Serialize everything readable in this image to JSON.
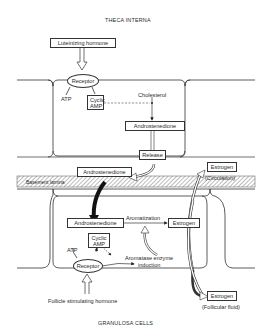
{
  "labels": {
    "top_title": "THECA INTERNA",
    "bottom_title": "GRANULOSA CELLS",
    "basement": "Basement lamina"
  },
  "theca": {
    "hormone": "Luteinizing hormone",
    "receptor": "Receptor",
    "atp": "ATP",
    "camp_line1": "Cyclic",
    "camp_line2": "AMP",
    "cholesterol": "Cholesterol",
    "androstenedione": "Androstenedione",
    "release": "Release"
  },
  "between": {
    "androstenedione": "Androstenedione",
    "estrogen_circ": "Estrogen",
    "circulation": "(Circulation)"
  },
  "granulosa": {
    "androstenedione": "Androstenedione",
    "aromatization": "Aromatization",
    "estrogen": "Estrogen",
    "camp_line1": "Cyclic",
    "camp_line2": "AMP",
    "atp": "ATP",
    "enzyme_line1": "Aromatase enzyme",
    "enzyme_line2": "induction",
    "receptor": "Receptor",
    "hormone": "Follicle stimulating hormone",
    "estrogen_ff": "Estrogen",
    "follicular": "(Follicular fluid)"
  }
}
